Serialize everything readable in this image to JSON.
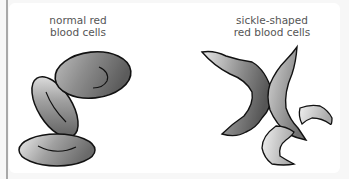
{
  "figure": {
    "panels": [
      {
        "id": "normal",
        "label_lines": [
          "normal red",
          "blood cells"
        ],
        "cell_count": 3,
        "shape": "biconcave disc (oval)"
      },
      {
        "id": "sickle",
        "label_lines": [
          "sickle-shaped",
          "red blood cells"
        ],
        "cell_count": 4,
        "shape": "sickle / crescent"
      }
    ],
    "colors": {
      "outline": "#111111",
      "cell_light": "#e6e6e6",
      "cell_dark": "#6e6e6e",
      "label_text": "#555555",
      "panel_bg": "#ffffff",
      "frame_bg": "#f7f7f7",
      "rule": "#a8a8a8"
    }
  }
}
